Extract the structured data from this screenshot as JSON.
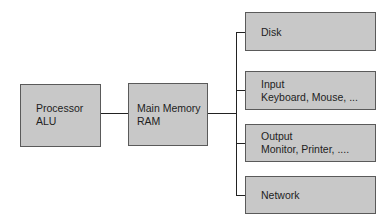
{
  "diagram": {
    "type": "block-diagram",
    "nodes": {
      "processor": {
        "lines": [
          "Processor",
          "ALU"
        ]
      },
      "main_memory": {
        "lines": [
          "Main Memory",
          "RAM"
        ]
      },
      "disk": {
        "lines": [
          "Disk"
        ]
      },
      "input": {
        "lines": [
          "Input",
          "Keyboard, Mouse, ..."
        ]
      },
      "output": {
        "lines": [
          "Output",
          "Monitor, Printer, ...."
        ]
      },
      "network": {
        "lines": [
          "Network"
        ]
      }
    },
    "edges": [
      {
        "from": "processor",
        "to": "main_memory"
      },
      {
        "from": "main_memory",
        "to": "disk"
      },
      {
        "from": "main_memory",
        "to": "input"
      },
      {
        "from": "main_memory",
        "to": "output"
      },
      {
        "from": "main_memory",
        "to": "network"
      }
    ],
    "colors": {
      "box_fill": "#c8c8c8",
      "box_border": "#5a5a5a",
      "connector": "#222222",
      "text": "#1e1e1e"
    }
  }
}
